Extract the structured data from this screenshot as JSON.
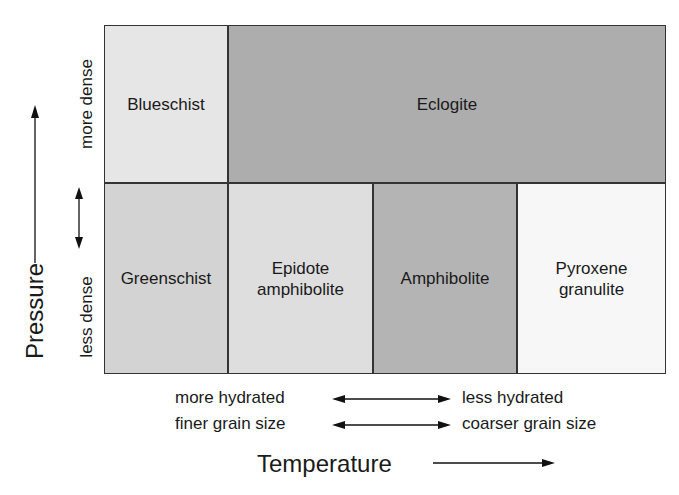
{
  "diagram": {
    "cells": [
      {
        "id": "blueschist",
        "label": "Blueschist",
        "color": "#e6e6e6"
      },
      {
        "id": "eclogite",
        "label": "Eclogite",
        "color": "#adadad"
      },
      {
        "id": "greenschist",
        "label": "Greenschist",
        "color": "#d3d3d3"
      },
      {
        "id": "epidote-amphibolite",
        "label_line1": "Epidote",
        "label_line2": "amphibolite",
        "color": "#dedede"
      },
      {
        "id": "amphibolite",
        "label": "Amphibolite",
        "color": "#b4b4b4"
      },
      {
        "id": "pyroxene-granulite",
        "label_line1": "Pyroxene",
        "label_line2": "granulite",
        "color": "#f7f7f7"
      }
    ],
    "y_axis": {
      "label": "Pressure",
      "upper_label": "more dense",
      "lower_label": "less dense"
    },
    "x_axis": {
      "label": "Temperature",
      "row1_left": "more hydrated",
      "row1_right": "less hydrated",
      "row2_left": "finer grain size",
      "row2_right": "coarser grain size"
    }
  }
}
